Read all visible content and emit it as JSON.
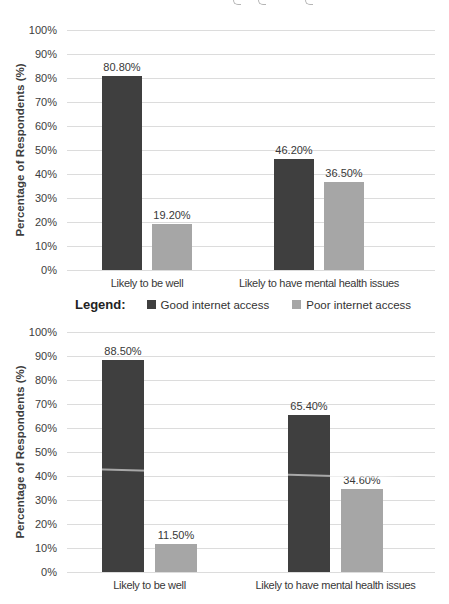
{
  "colors": {
    "series_good_internet": "#3f3f3f",
    "series_poor_internet": "#a6a6a6",
    "gridline": "#dcdcdc",
    "text": "#3d3d3d",
    "background": "#ffffff"
  },
  "legend": {
    "title": "Legend:",
    "items": [
      {
        "label": "Good internet access",
        "color": "#3f3f3f"
      },
      {
        "label": "Poor internet access",
        "color": "#a6a6a6"
      }
    ]
  },
  "chart_data": [
    {
      "type": "bar",
      "title": "",
      "xlabel": "",
      "ylabel": "Percentage of Respondents (%)",
      "ylim": [
        0,
        100
      ],
      "ytick_step": 10,
      "ytick_labels": [
        "0%",
        "10%",
        "20%",
        "30%",
        "40%",
        "50%",
        "60%",
        "70%",
        "80%",
        "90%",
        "100%"
      ],
      "grid": true,
      "legend_position": "below",
      "categories": [
        "Likely to be well",
        "Likely to have mental health issues"
      ],
      "series": [
        {
          "name": "Good internet access",
          "color": "#3f3f3f",
          "values": [
            80.8,
            46.2
          ],
          "labels": [
            "80.80%",
            "46.20%"
          ]
        },
        {
          "name": "Poor internet access",
          "color": "#a6a6a6",
          "values": [
            19.2,
            36.5
          ],
          "labels": [
            "19.20%",
            "36.50%"
          ]
        }
      ]
    },
    {
      "type": "bar",
      "title": "",
      "xlabel": "",
      "ylabel": "Percentage of Respondents (%)",
      "ylim": [
        0,
        100
      ],
      "ytick_step": 10,
      "ytick_labels": [
        "0%",
        "10%",
        "20%",
        "30%",
        "40%",
        "50%",
        "60%",
        "70%",
        "80%",
        "90%",
        "100%"
      ],
      "grid": true,
      "legend_position": "above",
      "categories": [
        "Likely to be well",
        "Likely to have mental health issues"
      ],
      "series": [
        {
          "name": "Good internet access",
          "color": "#3f3f3f",
          "values": [
            88.5,
            65.4
          ],
          "labels": [
            "88.50%",
            "65.40%"
          ]
        },
        {
          "name": "Poor internet access",
          "color": "#a6a6a6",
          "values": [
            11.5,
            34.6
          ],
          "labels": [
            "11.50%",
            "34.60%"
          ]
        }
      ]
    }
  ]
}
